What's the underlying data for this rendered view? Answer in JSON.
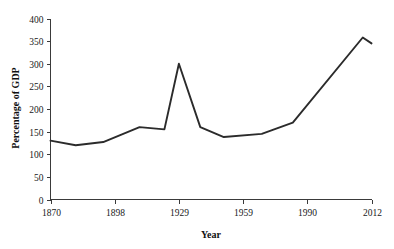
{
  "chart_data": {
    "type": "line",
    "title": "",
    "xlabel": "Year",
    "ylabel": "Percentage of GDP",
    "xlim": [
      1870,
      2012
    ],
    "ylim": [
      0,
      400
    ],
    "grid": false,
    "legend": "none",
    "xticks": [
      "1870",
      "1898",
      "1929",
      "1959",
      "1990",
      "2012"
    ],
    "xtick_values": [
      1870,
      1898,
      1929,
      1959,
      1990,
      2012
    ],
    "yticks": [
      "0",
      "50",
      "100",
      "150",
      "200",
      "250",
      "300",
      "350",
      "400"
    ],
    "ytick_values": [
      0,
      50,
      100,
      150,
      200,
      250,
      300,
      350,
      400
    ],
    "series": [
      {
        "name": "Percentage of GDP",
        "color": "#2b2b2b",
        "x": [
          1870,
          1881,
          1893,
          1910,
          1922,
          1929,
          1939,
          1950,
          1968,
          1983,
          2009,
          2012
        ],
        "values": [
          130,
          120,
          127,
          160,
          155,
          300,
          160,
          138,
          145,
          170,
          358,
          345
        ]
      }
    ]
  },
  "axes": {
    "x_title": "Year",
    "y_title": "Percentage of GDP"
  },
  "colors": {
    "line": "#2b2b2b",
    "axis": "#3a3a3a",
    "background": "#ffffff",
    "text": "#202020"
  }
}
